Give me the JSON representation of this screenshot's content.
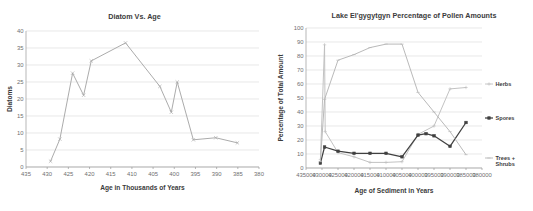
{
  "page": {
    "background": "#ffffff",
    "width": 533,
    "height": 211
  },
  "charts": [
    {
      "id": "diatom-chart",
      "name": "diatom-vs-age-chart"
    },
    {
      "id": "pollen-chart",
      "name": "lake-elgygytgyn-pollen-chart"
    }
  ],
  "chart_data": [
    {
      "type": "line",
      "id": "diatom-chart",
      "title": "Diatom Vs. Age",
      "xlabel": "Age in Thousands of Years",
      "ylabel": "Diatoms",
      "xlim": [
        435,
        380
      ],
      "ylim": [
        0,
        40
      ],
      "x_reversed": true,
      "xticks": [
        435,
        430,
        425,
        420,
        415,
        410,
        405,
        400,
        395,
        390,
        385,
        380
      ],
      "yticks": [
        0,
        5,
        10,
        15,
        20,
        25,
        30,
        35,
        40
      ],
      "grid": "horizontal",
      "legend": "none",
      "series": [
        {
          "name": "Diatoms",
          "color": "#a6a6a6",
          "marker": "x",
          "x": [
            429.2,
            427.0,
            424.0,
            421.4,
            419.6,
            411.5,
            403.4,
            400.7,
            399.3,
            395.5,
            390.2,
            385.1
          ],
          "y": [
            1.7,
            8.2,
            27.6,
            21.1,
            31.2,
            36.5,
            23.7,
            16.1,
            25.0,
            8.0,
            8.6,
            7.1
          ]
        }
      ]
    },
    {
      "type": "line",
      "id": "pollen-chart",
      "title": "Lake El'gygytgyn Percentage of Pollen Amounts",
      "xlabel": "Age of Sediment in Years",
      "ylabel": "Percentage of Total Amount",
      "xlim": [
        435000,
        380000
      ],
      "ylim": [
        0,
        100
      ],
      "x_reversed": true,
      "xticks": [
        435000,
        430000,
        425000,
        420000,
        415000,
        410000,
        405000,
        400000,
        395000,
        390000,
        385000,
        380000
      ],
      "yticks": [
        0,
        10,
        20,
        30,
        40,
        50,
        60,
        70,
        80,
        90,
        100
      ],
      "grid": "horizontal",
      "legend": "right",
      "series": [
        {
          "name": "Herbs",
          "color": "#bfbfbf",
          "marker": "plus",
          "x": [
            430500,
            429200,
            429000,
            425000,
            420000,
            415000,
            410000,
            405000,
            400000,
            395000,
            390000,
            385000
          ],
          "y": [
            6.0,
            88.0,
            26.0,
            11.0,
            8.0,
            4.0,
            4.0,
            4.5,
            24.0,
            30.0,
            56.5,
            57.5
          ]
        },
        {
          "name": "Spores",
          "color": "#404040",
          "marker": "square",
          "x": [
            430500,
            429200,
            425000,
            420000,
            415000,
            410000,
            405000,
            400000,
            397500,
            395000,
            390000,
            385000
          ],
          "y": [
            3.5,
            15.0,
            12.0,
            10.5,
            10.5,
            10.5,
            8.0,
            23.5,
            24.5,
            23.0,
            15.5,
            32.5
          ]
        },
        {
          "name": "Trees + Shrubs",
          "color": "#b5b5b5",
          "marker": "line",
          "x": [
            430500,
            429200,
            425000,
            420000,
            415000,
            410000,
            405000,
            400000,
            395000,
            390000,
            385000
          ],
          "y": [
            4.5,
            49.0,
            77.0,
            81.0,
            86.0,
            88.5,
            88.5,
            54.0,
            40.0,
            26.0,
            9.5
          ]
        }
      ],
      "legend_entries": [
        {
          "label": "Herbs",
          "color": "#bfbfbf",
          "marker": "plus"
        },
        {
          "label": "Spores",
          "color": "#404040",
          "marker": "square"
        },
        {
          "label": "Trees +\nShrubs",
          "color": "#b5b5b5",
          "marker": "line"
        }
      ]
    }
  ]
}
